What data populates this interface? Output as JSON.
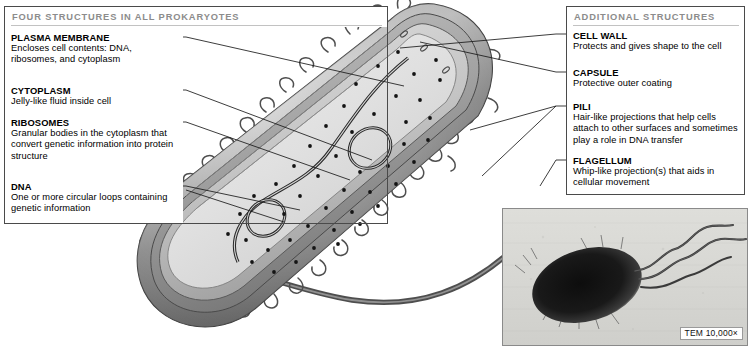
{
  "figure": {
    "type": "labeled-biology-diagram"
  },
  "left_panel": {
    "header": "FOUR STRUCTURES IN ALL PROKARYOTES",
    "entries": [
      {
        "label": "PLASMA MEMBRANE",
        "description": "Encloses cell contents: DNA, ribosomes, and cytoplasm"
      },
      {
        "label": "CYTOPLASM",
        "description": "Jelly-like fluid inside cell"
      },
      {
        "label": "RIBOSOMES",
        "description": "Granular bodies in the cytoplasm that convert genetic information into protein structure"
      },
      {
        "label": "DNA",
        "description": "One or more circular loops containing genetic information"
      }
    ]
  },
  "right_panel": {
    "header": "ADDITIONAL STRUCTURES",
    "entries": [
      {
        "label": "CELL WALL",
        "description": "Protects and gives shape to the cell"
      },
      {
        "label": "CAPSULE",
        "description": "Protective outer coating"
      },
      {
        "label": "PILI",
        "description": "Hair-like projections that help cells attach to other surfaces and sometimes play a role in DNA transfer"
      },
      {
        "label": "FLAGELLUM",
        "description": "Whip-like projection(s) that aids in cellular movement"
      }
    ]
  },
  "micrograph": {
    "caption": "TEM 10,000×",
    "subject": "bacterium with flagella"
  },
  "colors": {
    "panel_border": "#4a4a4a",
    "header_text": "#8c8c8c",
    "header_rule": "#c2c2c2",
    "leader_line": "#1a1a1a",
    "capsule_outer": "#6e6e6e",
    "cell_wall": "#9a9a9a",
    "membrane": "#bdbdbd",
    "cytoplasm": "#dcdcdc",
    "ribosome": "#111111",
    "flagellum": "#5a5a5a",
    "micrograph_bg": "#d8d8d4",
    "micrograph_cell": "#1d1d1d"
  }
}
